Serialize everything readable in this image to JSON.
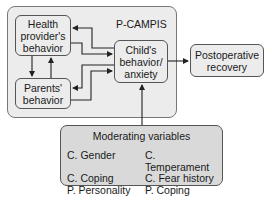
{
  "diagram": {
    "outer_group": {
      "label": "P-CAMPIS"
    },
    "nodes": {
      "health_provider": {
        "label_lines": [
          "Health",
          "provider's",
          "behavior"
        ]
      },
      "parents": {
        "label_lines": [
          "Parents'",
          "behavior"
        ]
      },
      "child": {
        "label_lines": [
          "Child's",
          "behavior/",
          "anxiety"
        ]
      },
      "postoperative": {
        "label_lines": [
          "Postoperative",
          "recovery"
        ]
      }
    },
    "moderating": {
      "title": "Moderating variables",
      "items": [
        "C. Gender",
        "C. Temperament",
        "C. Coping",
        "C. Fear history",
        "P. Personality",
        "P. Coping"
      ]
    },
    "edges": [
      {
        "from": "health_provider",
        "to": "parents"
      },
      {
        "from": "parents",
        "to": "health_provider"
      },
      {
        "from": "health_provider",
        "to": "child"
      },
      {
        "from": "child",
        "to": "health_provider"
      },
      {
        "from": "parents",
        "to": "child"
      },
      {
        "from": "child",
        "to": "parents"
      },
      {
        "from": "child",
        "to": "postoperative"
      },
      {
        "from": "moderating",
        "to": "child"
      }
    ],
    "colors": {
      "group_fill": "#ececec",
      "moderating_fill": "#d9d9d9",
      "stroke": "#222222"
    }
  }
}
